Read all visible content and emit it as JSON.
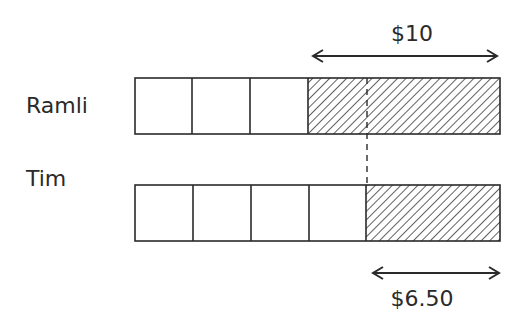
{
  "diagram": {
    "type": "bar-model",
    "rows": [
      {
        "name": "Ramli",
        "plain_units": 3,
        "hatched_label": "$10"
      },
      {
        "name": "Tim",
        "plain_units": 4,
        "hatched_label": "$6.50"
      }
    ],
    "labels": {
      "ramli": "Ramli",
      "tim": "Tim",
      "top_amount": "$10",
      "bottom_amount": "$6.50"
    },
    "colors": {
      "line": "#2a2a2a",
      "hatch": "#3a3a3a",
      "background": "#ffffff"
    }
  }
}
